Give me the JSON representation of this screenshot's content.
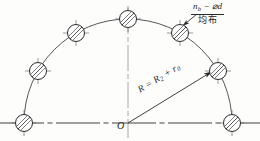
{
  "figure": {
    "background_color": "#fdfdfc",
    "line_color": "#2a2a2a",
    "centerline_color": "#8a8a8a"
  },
  "labels": {
    "callout": {
      "numerator_quantity": "n",
      "numerator_quantity_sub": "b",
      "numerator_separator": " − ",
      "numerator_diameter_symbol": "⌀",
      "numerator_diameter_var": "d",
      "numerator_full": "n_b − ⌀d",
      "denominator": "均布",
      "meaning": "uniformly distributed"
    },
    "radius": {
      "text": "R = R₂ + r₀",
      "symbol": "R",
      "equals": " = ",
      "term1": "R",
      "term1_sub": "2",
      "plus": " + ",
      "term2": "r",
      "term2_sub": "0"
    },
    "origin": {
      "text": "O"
    }
  },
  "geometry": {
    "center": {
      "x": 128,
      "y": 123
    },
    "arc_radius": 104,
    "hole_radius": 8.5,
    "hole_count": 7,
    "holes": [
      {
        "index": 1,
        "angle_deg": 180,
        "cx": 24,
        "cy": 123
      },
      {
        "index": 2,
        "angle_deg": 150,
        "cx": 38,
        "cy": 71
      },
      {
        "index": 3,
        "angle_deg": 120,
        "cx": 76,
        "cy": 33
      },
      {
        "index": 4,
        "angle_deg": 90,
        "cx": 128,
        "cy": 19
      },
      {
        "index": 5,
        "angle_deg": 60,
        "cx": 180,
        "cy": 33
      },
      {
        "index": 6,
        "angle_deg": 30,
        "cx": 218,
        "cy": 71
      },
      {
        "index": 7,
        "angle_deg": 0,
        "cx": 232,
        "cy": 123
      }
    ],
    "baseline": {
      "x1": 0,
      "y1": 123,
      "x2": 260,
      "y2": 123
    },
    "vertical_centerline": {
      "x1": 128,
      "y1": 10,
      "x2": 128,
      "y2": 138
    },
    "radius_dimension": {
      "x1": 128,
      "y1": 123,
      "x2": 213,
      "y2": 71
    },
    "leader_line": {
      "x1": 196,
      "y1": 14,
      "x2": 181,
      "y2": 27
    }
  }
}
